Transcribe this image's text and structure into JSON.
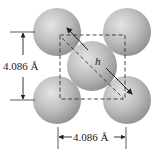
{
  "diagram": {
    "labels": {
      "vertical_dimension": "4.086 Å",
      "horizontal_dimension": "4.086 Å",
      "diagonal": "h"
    },
    "atoms": [
      {
        "name": "top-left",
        "cx": 57,
        "cy": 32,
        "r": 24
      },
      {
        "name": "top-right",
        "cx": 127,
        "cy": 32,
        "r": 24
      },
      {
        "name": "bottom-left",
        "cx": 57,
        "cy": 100,
        "r": 24
      },
      {
        "name": "bottom-right",
        "cx": 127,
        "cy": 100,
        "r": 24
      },
      {
        "name": "center",
        "cx": 92,
        "cy": 66,
        "r": 25
      }
    ],
    "colors": {
      "atom_light": "#e2e2e2",
      "atom_mid": "#b9b9b9",
      "atom_dark": "#8e8e8e",
      "line": "#222222"
    }
  }
}
